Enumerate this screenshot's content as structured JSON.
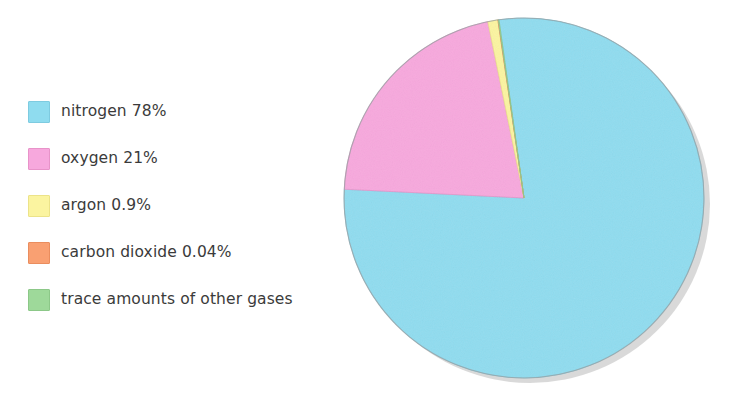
{
  "chart_data": {
    "type": "pie",
    "title": "",
    "subtitle": "",
    "xlabel": "",
    "ylabel": "",
    "legend_position": "left",
    "grid": false,
    "unit": "%",
    "start_angle_deg": -8,
    "direction": "clockwise",
    "categories": [
      "nitrogen",
      "oxygen",
      "argon",
      "carbon dioxide",
      "trace amounts of other gases"
    ],
    "values": [
      78,
      21,
      0.9,
      0.04,
      0.06
    ],
    "value_labels": [
      "78%",
      "21%",
      "0.9%",
      "0.04%",
      ""
    ],
    "colors": [
      "#8fdcef",
      "#f7a8dd",
      "#fbf4a0",
      "#f9a072",
      "#9ed99a"
    ],
    "slices": [
      {
        "label": "nitrogen 78%",
        "name": "nitrogen",
        "value": 78,
        "display": "78%",
        "color": "#8fdcef",
        "edge": "#7ecbe0"
      },
      {
        "label": "oxygen 21%",
        "name": "oxygen",
        "value": 21,
        "display": "21%",
        "color": "#f7a8dd",
        "edge": "#e893c9"
      },
      {
        "label": "argon 0.9%",
        "name": "argon",
        "value": 0.9,
        "display": "0.9%",
        "color": "#fbf4a0",
        "edge": "#ece389"
      },
      {
        "label": "carbon dioxide 0.04%",
        "name": "carbon dioxide",
        "value": 0.04,
        "display": "0.04%",
        "color": "#f9a072",
        "edge": "#ea8d5e"
      },
      {
        "label": "trace amounts of other gases",
        "name": "trace gases",
        "value": 0.06,
        "display": "",
        "color": "#9ed99a",
        "edge": "#8cc888"
      }
    ]
  },
  "legend": {
    "items": [
      {
        "label": "nitrogen 78%",
        "color": "#8fdcef",
        "border": "#7ecbe0"
      },
      {
        "label": "oxygen 21%",
        "color": "#f7a8dd",
        "border": "#e893c9"
      },
      {
        "label": "argon 0.9%",
        "color": "#fbf4a0",
        "border": "#ece389"
      },
      {
        "label": "carbon dioxide 0.04%",
        "color": "#f9a072",
        "border": "#ea8d5e"
      },
      {
        "label": "trace amounts of other gases",
        "color": "#9ed99a",
        "border": "#8cc888"
      }
    ]
  },
  "style": {
    "background": "#ffffff",
    "text_color": "#3b3b3b",
    "shadow_color": "#b9b9b9"
  }
}
